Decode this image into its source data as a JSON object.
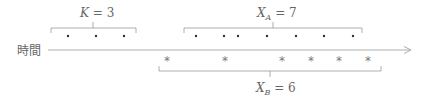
{
  "axis": {
    "label": "時間",
    "color": "#888888"
  },
  "groups": {
    "K": {
      "var": "K",
      "sub": "",
      "eq": " = 3",
      "count": 3,
      "marker": "•"
    },
    "XA": {
      "var": "X",
      "sub": "A",
      "eq": " = 7",
      "count": 7,
      "marker": "•"
    },
    "XB": {
      "var": "X",
      "sub": "B",
      "eq": " = 6",
      "count": 6,
      "marker": "*"
    }
  },
  "colors": {
    "stroke": "#999999",
    "dot": "#333333",
    "star": "#777777",
    "text": "#666666"
  }
}
